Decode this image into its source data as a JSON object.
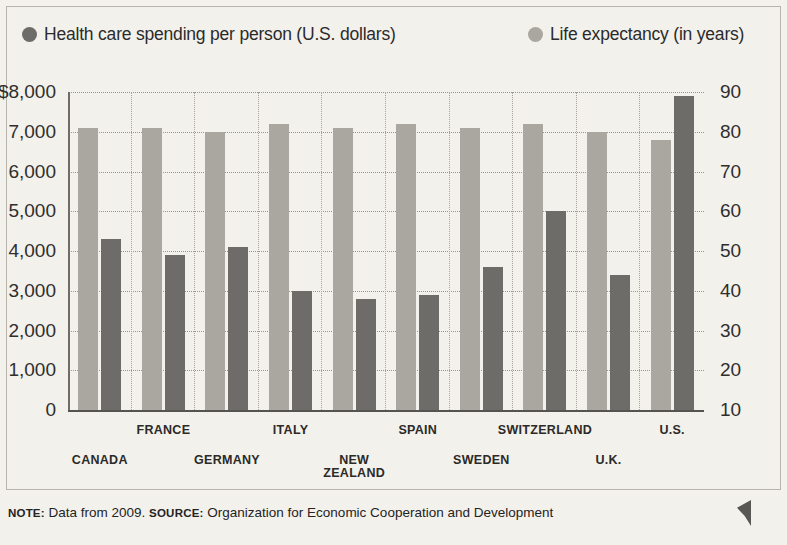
{
  "legend": {
    "spending": {
      "label": "Health care spending per person (U.S. dollars)",
      "color": "#6e6c68"
    },
    "life": {
      "label": "Life expectancy (in years)",
      "color": "#aaa7a0"
    }
  },
  "footnote": {
    "note_lead": "NOTE:",
    "note_text": " Data from 2009.",
    "source_lead": "SOURCE:",
    "source_text": " Organization for Economic Cooperation and Development"
  },
  "axes": {
    "left_ticks": [
      "$8,000",
      "7,000",
      "6,000",
      "5,000",
      "4,000",
      "3,000",
      "2,000",
      "1,000",
      "0"
    ],
    "right_ticks": [
      "90",
      "80",
      "70",
      "60",
      "50",
      "40",
      "30",
      "20",
      "10"
    ]
  },
  "chart_data": {
    "type": "bar",
    "title": "",
    "xlabel": "",
    "ylabel": "Health care spending per person (U.S. dollars)",
    "y2label": "Life expectancy (in years)",
    "ylim": [
      0,
      8000
    ],
    "y2lim": [
      10,
      90
    ],
    "grid": true,
    "legend_position": "top",
    "categories": [
      "CANADA",
      "FRANCE",
      "GERMANY",
      "ITALY",
      "NEW ZEALAND",
      "SPAIN",
      "SWEDEN",
      "SWITZERLAND",
      "U.K.",
      "U.S."
    ],
    "series": [
      {
        "name": "Life expectancy (in years)",
        "axis": "right",
        "color": "#aaa7a0",
        "values": [
          81,
          81,
          80,
          82,
          81,
          82,
          81,
          82,
          80,
          78
        ]
      },
      {
        "name": "Health care spending per person (U.S. dollars)",
        "axis": "left",
        "color": "#6e6c68",
        "values": [
          4300,
          3900,
          4100,
          3000,
          2800,
          2900,
          3600,
          5000,
          3400,
          7900
        ]
      }
    ]
  }
}
